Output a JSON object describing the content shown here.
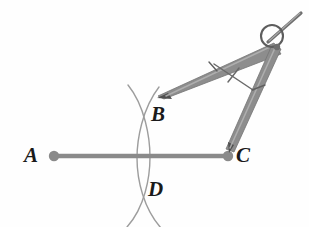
{
  "figure": {
    "background_color": "#fefefe",
    "labels": [
      {
        "id": "A",
        "text": "A",
        "x": 54,
        "y": 156,
        "role": "segment-endpoint"
      },
      {
        "id": "B",
        "text": "B",
        "x": 145,
        "y": 124,
        "role": "arc-intersection-upper"
      },
      {
        "id": "C",
        "text": "C",
        "x": 228,
        "y": 156,
        "role": "segment-endpoint"
      },
      {
        "id": "D",
        "text": "D",
        "x": 145,
        "y": 192,
        "role": "arc-intersection-lower"
      }
    ],
    "segment": {
      "name": "AC",
      "from": {
        "x": 54,
        "y": 156
      },
      "to": {
        "x": 228,
        "y": 156
      },
      "color": "#8a8a8a",
      "stroke_width": 4,
      "endpoint_dot_radius": 5,
      "endpoint_dot_color": "#8a8a8a"
    },
    "arcs": [
      {
        "name": "arc-centered-at-A",
        "center": {
          "x": 54,
          "y": 156
        },
        "radius": 92,
        "color": "#9a9a9a",
        "stroke_width": 1.3,
        "path": "M 128,86 C 146,108 150,140 150,156 C 150,176 146,206 128,226"
      },
      {
        "name": "arc-centered-at-C",
        "center": {
          "x": 228,
          "y": 156
        },
        "radius": 92,
        "color": "#9a9a9a",
        "stroke_width": 1.3,
        "path": "M 158,88 C 142,110 138,140 138,158 C 138,180 144,208 160,228"
      }
    ],
    "compass": {
      "name": "drafting-compass",
      "body_color": "#8d8d8d",
      "outline_color": "#6f6f6f",
      "hinge": {
        "x": 272,
        "y": 37,
        "ring_radius": 11,
        "ring_color": "#5a5a5a"
      },
      "pivot": {
        "x": 277,
        "y": 48
      },
      "handle": {
        "from": {
          "x": 272,
          "y": 40
        },
        "to": {
          "x": 300,
          "y": 14
        },
        "color": "#6e6e6e"
      },
      "pencil_leg": {
        "name": "pencil-leg",
        "from": {
          "x": 277,
          "y": 48
        },
        "to": {
          "x": 157,
          "y": 97
        },
        "tip_color": "#4a4a4a",
        "tick_at": {
          "x": 213,
          "y": 66
        }
      },
      "needle_leg": {
        "name": "needle-leg",
        "from": {
          "x": 277,
          "y": 48
        },
        "to": {
          "x": 228,
          "y": 152
        },
        "tip_color": "#4a4a4a",
        "tick_at": {
          "x": 258,
          "y": 88
        }
      },
      "measure_line": {
        "name": "compass-width-indicator",
        "from": {
          "x": 214,
          "y": 64
        },
        "to": {
          "x": 252,
          "y": 89
        },
        "color": "#6a6a6a",
        "tick_at": {
          "x": 233,
          "y": 76
        }
      }
    }
  }
}
